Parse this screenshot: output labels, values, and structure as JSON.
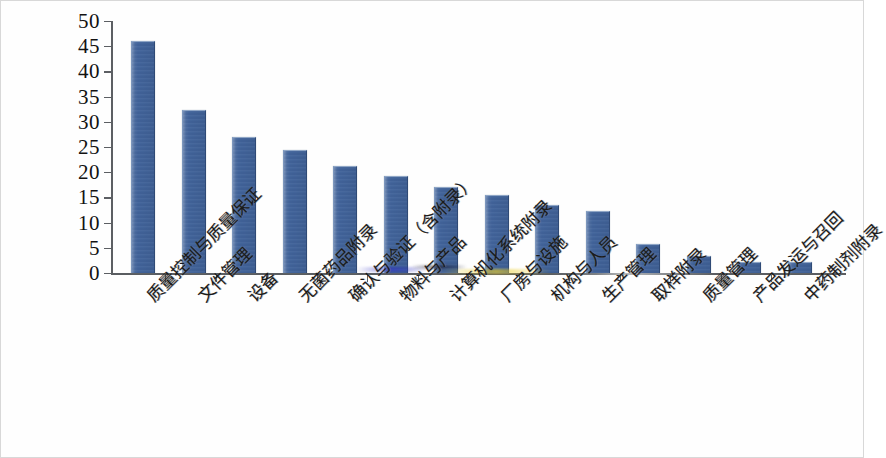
{
  "chart_data": {
    "type": "bar",
    "title": "",
    "xlabel": "",
    "ylabel": "",
    "ylim": [
      0,
      50
    ],
    "ytick_step": 5,
    "grid": false,
    "legend": "none",
    "bar_color": "#41639a",
    "axis_color": "#5c5f63",
    "categories": [
      "质量控制与质量保证",
      "文件管理",
      "设备",
      "无菌药品附录",
      "确认与验证（含附录）",
      "物料与产品",
      "计算机化系统附录",
      "厂房与设施",
      "机构与人员",
      "生产管理",
      "取样附录",
      "质量管理",
      "产品发运与召回",
      "中药制剂附录"
    ],
    "values": [
      45.8,
      32.1,
      26.8,
      24.3,
      21.0,
      19.0,
      16.9,
      15.2,
      13.2,
      12.2,
      5.5,
      3.2,
      2.0,
      1.9
    ],
    "yticks": [
      0,
      5,
      10,
      15,
      20,
      25,
      30,
      35,
      40,
      45,
      50
    ],
    "ytick_labels": [
      "0",
      "5",
      "10",
      "15",
      "20",
      "25",
      "30",
      "35",
      "40",
      "45",
      "50"
    ]
  }
}
